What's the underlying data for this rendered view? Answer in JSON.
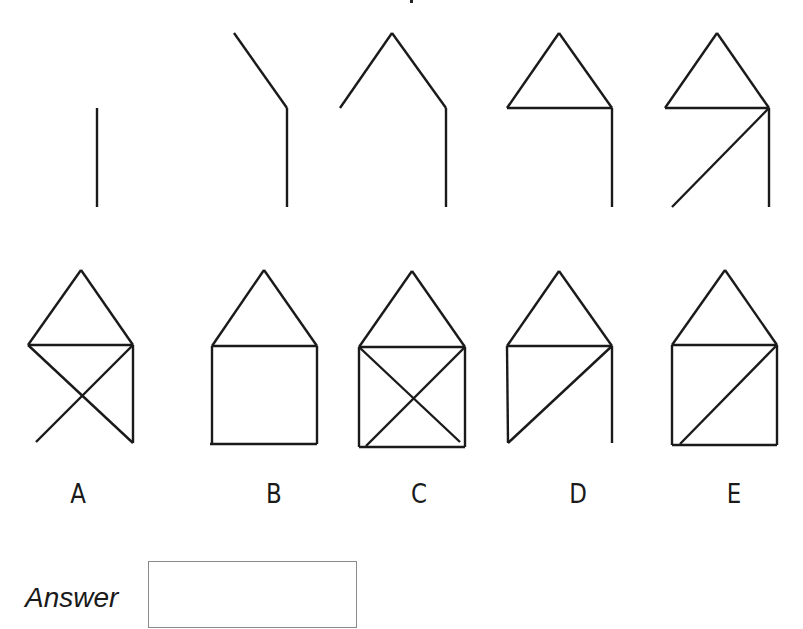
{
  "puzzle": {
    "clipped_title_fragment": "",
    "sequence_figures": [
      {
        "id": "seq-1",
        "segments": [
          [
            97,
            108,
            97,
            207
          ]
        ]
      },
      {
        "id": "seq-2",
        "segments": [
          [
            234,
            33,
            287,
            108
          ],
          [
            287,
            108,
            287,
            207
          ]
        ]
      },
      {
        "id": "seq-3",
        "segments": [
          [
            340,
            108,
            392,
            33
          ],
          [
            392,
            33,
            446,
            108
          ],
          [
            446,
            108,
            446,
            207
          ]
        ]
      },
      {
        "id": "seq-4",
        "segments": [
          [
            507,
            108,
            559,
            33
          ],
          [
            559,
            33,
            612,
            108
          ],
          [
            507,
            108,
            612,
            108
          ],
          [
            612,
            108,
            612,
            207
          ]
        ]
      },
      {
        "id": "seq-5",
        "segments": [
          [
            665,
            108,
            717,
            33
          ],
          [
            717,
            33,
            769,
            108
          ],
          [
            665,
            108,
            769,
            108
          ],
          [
            769,
            108,
            769,
            207
          ],
          [
            769,
            108,
            672,
            207
          ]
        ]
      }
    ],
    "options": [
      {
        "label": "A",
        "label_x": 78,
        "segments": [
          [
            28,
            345,
            81,
            270
          ],
          [
            81,
            270,
            133,
            345
          ],
          [
            28,
            345,
            133,
            345
          ],
          [
            133,
            345,
            133,
            443
          ],
          [
            28,
            345,
            133,
            443
          ],
          [
            133,
            345,
            36,
            442
          ]
        ]
      },
      {
        "label": "B",
        "label_x": 274,
        "segments": [
          [
            212,
            346,
            264,
            270
          ],
          [
            264,
            270,
            317,
            346
          ],
          [
            212,
            346,
            317,
            346
          ],
          [
            212,
            346,
            212,
            444
          ],
          [
            317,
            346,
            317,
            444
          ],
          [
            210,
            444,
            317,
            444
          ]
        ]
      },
      {
        "label": "C",
        "label_x": 419,
        "segments": [
          [
            359,
            347,
            412,
            271
          ],
          [
            412,
            271,
            465,
            347
          ],
          [
            359,
            347,
            465,
            347
          ],
          [
            359,
            347,
            359,
            447
          ],
          [
            465,
            347,
            465,
            447
          ],
          [
            359,
            447,
            465,
            447
          ],
          [
            359,
            347,
            460,
            442
          ],
          [
            465,
            347,
            366,
            446
          ]
        ]
      },
      {
        "label": "D",
        "label_x": 578,
        "segments": [
          [
            507,
            346,
            559,
            271
          ],
          [
            559,
            271,
            612,
            346
          ],
          [
            507,
            346,
            612,
            346
          ],
          [
            507,
            346,
            508,
            443
          ],
          [
            612,
            346,
            508,
            443
          ],
          [
            612,
            346,
            612,
            443
          ]
        ]
      },
      {
        "label": "E",
        "label_x": 734,
        "segments": [
          [
            672,
            345,
            725,
            270
          ],
          [
            725,
            270,
            777,
            345
          ],
          [
            672,
            345,
            777,
            345
          ],
          [
            672,
            345,
            672,
            445
          ],
          [
            777,
            345,
            777,
            445
          ],
          [
            672,
            445,
            777,
            445
          ],
          [
            777,
            345,
            680,
            444
          ]
        ]
      }
    ],
    "answer": {
      "label": "Answer",
      "value": ""
    }
  }
}
